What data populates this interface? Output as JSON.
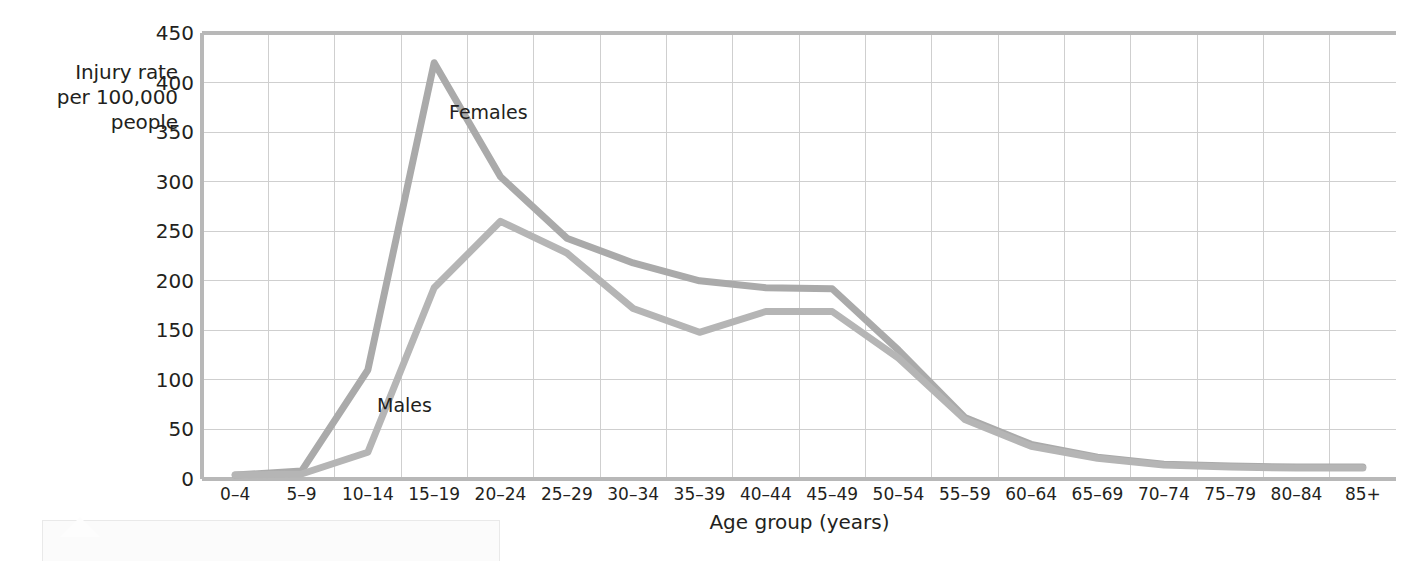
{
  "chart_data": {
    "type": "line",
    "title": "",
    "xlabel": "Age group (years)",
    "ylabel": "Injury rate per 100,000 people",
    "ylabel_lines": [
      "Injury rate",
      "per 100,000",
      "people"
    ],
    "categories": [
      "0–4",
      "5–9",
      "10–14",
      "15–19",
      "20–24",
      "25–29",
      "30–34",
      "35–39",
      "40–44",
      "45–49",
      "50–54",
      "55–59",
      "60–64",
      "65–69",
      "70–74",
      "75–79",
      "80–84",
      "85+"
    ],
    "yticks": [
      0,
      50,
      100,
      150,
      200,
      250,
      300,
      350,
      400,
      450
    ],
    "ylim": [
      0,
      450
    ],
    "grid": true,
    "legend": "inline-labels",
    "series": [
      {
        "name": "Females",
        "color": "#aaaaaa",
        "label_position": "inline-right-of-peak",
        "values": [
          4,
          8,
          110,
          420,
          305,
          243,
          218,
          200,
          193,
          192,
          130,
          62,
          35,
          22,
          15,
          13,
          12,
          12
        ]
      },
      {
        "name": "Males",
        "color": "#b5b5b5",
        "label_position": "inline-lower-left",
        "values": [
          4,
          5,
          27,
          193,
          260,
          228,
          172,
          148,
          169,
          169,
          122,
          60,
          33,
          21,
          14,
          12,
          11,
          11
        ]
      }
    ]
  },
  "axis": {
    "y_tick_labels": [
      "450",
      "400",
      "350",
      "300",
      "250",
      "200",
      "150",
      "100",
      "50",
      "0"
    ],
    "x_tick_labels": [
      "0–4",
      "5–9",
      "10–14",
      "15–19",
      "20–24",
      "25–29",
      "30–34",
      "35–39",
      "40–44",
      "45–49",
      "50–54",
      "55–59",
      "60–64",
      "65–69",
      "70–74",
      "75–79",
      "80–84",
      "85+"
    ]
  },
  "labels": {
    "females": "Females",
    "males": "Males",
    "x_axis_title": "Age group (years)"
  },
  "colors": {
    "line": "#aaaaaa",
    "grid": "#cfcfcf",
    "axis": "#b8b8b8",
    "text": "#231f20",
    "background": "#ffffff"
  }
}
